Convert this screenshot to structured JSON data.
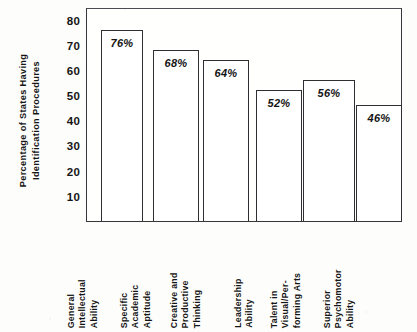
{
  "chart_data": {
    "type": "bar",
    "title": "",
    "xlabel": "",
    "ylabel": "Percentage of States Having Identification Procedures",
    "ylabel_lines": [
      "Percentage of States Having",
      "Identification Procedures"
    ],
    "ylim": [
      0,
      85
    ],
    "y_ticks": [
      10,
      20,
      30,
      40,
      50,
      60,
      70,
      80
    ],
    "y_tick_labels": [
      "10",
      "20",
      "30",
      "40",
      "50",
      "60",
      "70",
      "80"
    ],
    "grid": false,
    "legend": false,
    "categories": [
      "General Intellectual Ability",
      "Specific Academic Aptitude",
      "Creative and Productive Thinking",
      "Leadership Ability",
      "Talent in Visual/Performing Arts",
      "Superior Psychomotor Ability"
    ],
    "category_label_lines": [
      [
        "General",
        "Intellectual",
        "Ability"
      ],
      [
        "Specific",
        "Academic",
        "Aptitude"
      ],
      [
        "Creative and",
        "Productive",
        "Thinking"
      ],
      [
        "Leadership",
        "Ability"
      ],
      [
        "Talent in",
        "Visual/Per-",
        "forming Arts"
      ],
      [
        "Superior",
        "Psychomotor",
        "Ability"
      ]
    ],
    "values": [
      76,
      68,
      64,
      52,
      56,
      46
    ],
    "value_labels": [
      "76%",
      "68%",
      "64%",
      "52%",
      "56%",
      "46%"
    ],
    "bar_style": {
      "fill": "#ffffff",
      "edge": "#2e2e33",
      "label_position": "inside-top"
    },
    "bar_geometry": [
      {
        "left": 14,
        "width": 42
      },
      {
        "left": 66,
        "width": 46
      },
      {
        "left": 116,
        "width": 46
      },
      {
        "left": 169,
        "width": 46
      },
      {
        "left": 216,
        "width": 52
      },
      {
        "left": 269,
        "width": 46
      }
    ],
    "label_geometry": [
      {
        "left": 100
      },
      {
        "left": 153
      },
      {
        "left": 203
      },
      {
        "left": 256
      },
      {
        "left": 303
      },
      {
        "left": 356
      }
    ]
  },
  "colors": {
    "ink": "#1c1c1c",
    "bar_edge": "#2e2e33",
    "frame": "#35353a",
    "page_background": "#fdfdfb",
    "bar_fill": "#ffffff"
  }
}
